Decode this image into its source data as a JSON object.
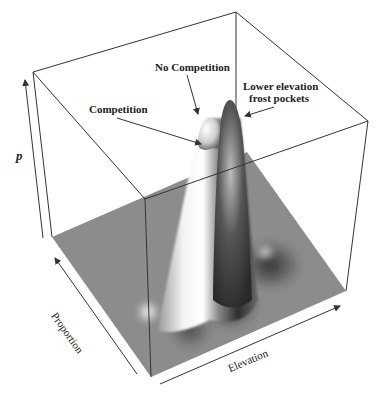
{
  "figure": {
    "type": "3D surface / density plot",
    "annotations": {
      "no_competition": "No Competition",
      "competition": "Competition",
      "frost_line1": "Lower elevation",
      "frost_line2": "frost pockets"
    },
    "axes": {
      "z": "p",
      "x": "Elevation",
      "y": "Proportion"
    },
    "colors": {
      "floor": "#8a8a8a",
      "box_lines": "#333333",
      "text": "#222222"
    }
  }
}
